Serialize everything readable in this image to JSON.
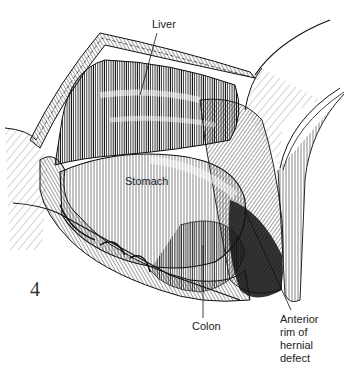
{
  "figure": {
    "number": "4",
    "labels": {
      "liver": "Liver",
      "stomach": "Stomach",
      "colon": "Colon",
      "anterior_rim": "Anterior\nrim of\nhernial\ndefect"
    },
    "colors": {
      "ink": "#111111",
      "background": "#ffffff"
    }
  }
}
